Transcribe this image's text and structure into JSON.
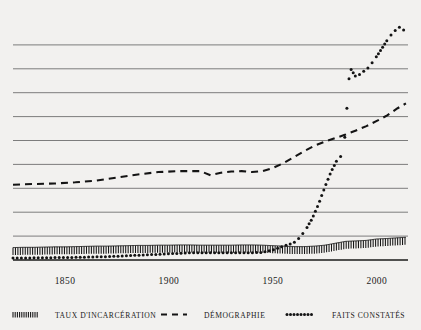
{
  "chart_data": {
    "type": "line",
    "title": "",
    "subtitle": "",
    "xlabel": "",
    "ylabel": "",
    "xlim": [
      1825,
      2015
    ],
    "ylim": [
      0,
      10
    ],
    "grid": true,
    "gridline_values": [
      1,
      2,
      3,
      4,
      5,
      6,
      7,
      8,
      9
    ],
    "legend_position": "bottom",
    "xticks": [
      1850,
      1900,
      1950,
      2000
    ],
    "xtick_labels": [
      "1850",
      "1900",
      "1950",
      "2000"
    ],
    "yticks": [],
    "ytick_labels": [],
    "series": [
      {
        "name": "TAUX D'INCARCÉRATION",
        "style": "hatched",
        "color": "#141414",
        "x": [
          1825,
          1830,
          1835,
          1840,
          1845,
          1850,
          1855,
          1860,
          1865,
          1870,
          1875,
          1880,
          1885,
          1890,
          1895,
          1900,
          1905,
          1910,
          1915,
          1920,
          1925,
          1930,
          1935,
          1940,
          1945,
          1950,
          1955,
          1960,
          1965,
          1970,
          1975,
          1980,
          1985,
          1990,
          1995,
          2000,
          2005,
          2010,
          2014
        ],
        "y": [
          0.52,
          0.53,
          0.53,
          0.54,
          0.55,
          0.55,
          0.56,
          0.57,
          0.58,
          0.58,
          0.59,
          0.6,
          0.61,
          0.61,
          0.62,
          0.62,
          0.63,
          0.63,
          0.62,
          0.62,
          0.62,
          0.62,
          0.63,
          0.63,
          0.62,
          0.6,
          0.58,
          0.56,
          0.56,
          0.58,
          0.62,
          0.7,
          0.78,
          0.8,
          0.82,
          0.88,
          0.9,
          0.93,
          0.95
        ]
      },
      {
        "name": "DÉMOGRAPHIE",
        "style": "dashed",
        "color": "#141414",
        "x": [
          1825,
          1835,
          1845,
          1855,
          1865,
          1875,
          1885,
          1895,
          1905,
          1915,
          1920,
          1925,
          1930,
          1935,
          1940,
          1945,
          1950,
          1955,
          1960,
          1965,
          1970,
          1975,
          1980,
          1985,
          1990,
          1995,
          2000,
          2005,
          2010,
          2014
        ],
        "y": [
          3.15,
          3.18,
          3.2,
          3.25,
          3.32,
          3.45,
          3.58,
          3.68,
          3.72,
          3.72,
          3.55,
          3.65,
          3.7,
          3.72,
          3.68,
          3.72,
          3.85,
          4.05,
          4.3,
          4.55,
          4.78,
          4.95,
          5.1,
          5.25,
          5.42,
          5.6,
          5.82,
          6.05,
          6.35,
          6.55
        ]
      },
      {
        "name": "FAITS CONSTATÉS",
        "style": "dotted",
        "color": "#141414",
        "x": [
          1825,
          1830,
          1835,
          1840,
          1845,
          1850,
          1855,
          1860,
          1865,
          1870,
          1875,
          1880,
          1885,
          1890,
          1895,
          1900,
          1905,
          1910,
          1915,
          1920,
          1925,
          1930,
          1935,
          1940,
          1945,
          1950,
          1955,
          1960,
          1963,
          1966,
          1969,
          1972,
          1975,
          1978,
          1981,
          1984,
          1985,
          1987,
          1990,
          1993,
          1996,
          1999,
          2002,
          2005,
          2008,
          2011,
          2014
        ],
        "y": [
          0.08,
          0.08,
          0.09,
          0.09,
          0.1,
          0.1,
          0.11,
          0.12,
          0.13,
          0.14,
          0.16,
          0.18,
          0.2,
          0.22,
          0.24,
          0.26,
          0.28,
          0.3,
          0.3,
          0.3,
          0.3,
          0.3,
          0.3,
          0.3,
          0.32,
          0.42,
          0.58,
          0.72,
          0.95,
          1.3,
          1.75,
          2.35,
          3.05,
          3.7,
          4.2,
          4.45,
          5.6,
          8.05,
          7.65,
          7.85,
          8.05,
          8.4,
          8.8,
          9.2,
          9.55,
          9.75,
          9.55
        ]
      }
    ]
  },
  "legend": {
    "items": [
      {
        "label": "TAUX D'INCARCÉRATION",
        "swatch": "hatched-swatch"
      },
      {
        "label": "DÉMOGRAPHIE",
        "swatch": "dashed-swatch"
      },
      {
        "label": "FAITS CONSTATÉS",
        "swatch": "dotted-swatch"
      }
    ]
  },
  "colors": {
    "background": "#f2f1ef",
    "gridline": "#6f6f6f",
    "baseline": "#1a1a1a",
    "ink": "#141414"
  }
}
